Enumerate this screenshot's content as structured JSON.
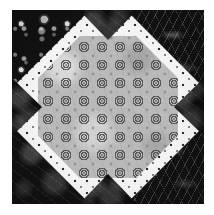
{
  "image": {
    "title": "Pieced quilt block",
    "width": 214,
    "height": 215,
    "background_color": "#ffffff"
  },
  "block": {
    "name": "square-quilt-block",
    "description": "Square patchwork block with white polka-dot ground, four black print corner triangles, four black edge triangles pointing inward, and a large gray octagonal center printed with a grid of circular ring medallions.",
    "border_color": "#f4f4f4",
    "size_px": 192
  },
  "background_fabric": {
    "name": "white-polka-dot-fabric",
    "base_color": "#f4f4f4",
    "dot_color": "#2e2e2e",
    "dot_spacing_px": 12,
    "dot_radius_px": 1.3
  },
  "corner_triangles": [
    {
      "position": "top-left",
      "fabric": "black-bubble-print",
      "base_color": "#111111",
      "motif": "circles-bubbles"
    },
    {
      "position": "top-right",
      "fabric": "black-feather-print",
      "base_color": "#0c0c0c",
      "motif": "feathery-swirl-lines"
    },
    {
      "position": "bottom-left",
      "fabric": "black-mottled-print",
      "base_color": "#101010",
      "motif": "mottled-marble"
    },
    {
      "position": "bottom-right",
      "fabric": "black-feather-print",
      "base_color": "#0c0c0c",
      "motif": "feathery-swirl-lines"
    }
  ],
  "edge_triangles": [
    {
      "position": "top",
      "points": "down",
      "base_color": "#0d0d0d",
      "fabric": "black-print"
    },
    {
      "position": "right",
      "points": "left",
      "base_color": "#0d0d0d",
      "fabric": "black-print"
    },
    {
      "position": "bottom",
      "points": "up",
      "base_color": "#0d0d0d",
      "fabric": "black-print"
    },
    {
      "position": "left",
      "points": "right",
      "base_color": "#0d0d0d",
      "fabric": "black-print"
    }
  ],
  "center": {
    "shape": "octagon",
    "fabric": "gray-medallion-print",
    "base_color": "#b8b8b8",
    "motif": "concentric-ring-medallions",
    "motif_color": "#4a4a4a",
    "grid_columns": 7,
    "grid_rows": 7,
    "motif_spacing_px": 18
  },
  "palette": {
    "white": "#f4f4f4",
    "black": "#111111",
    "gray": "#b8b8b8",
    "dot": "#2e2e2e",
    "motif": "#4a4a4a"
  }
}
